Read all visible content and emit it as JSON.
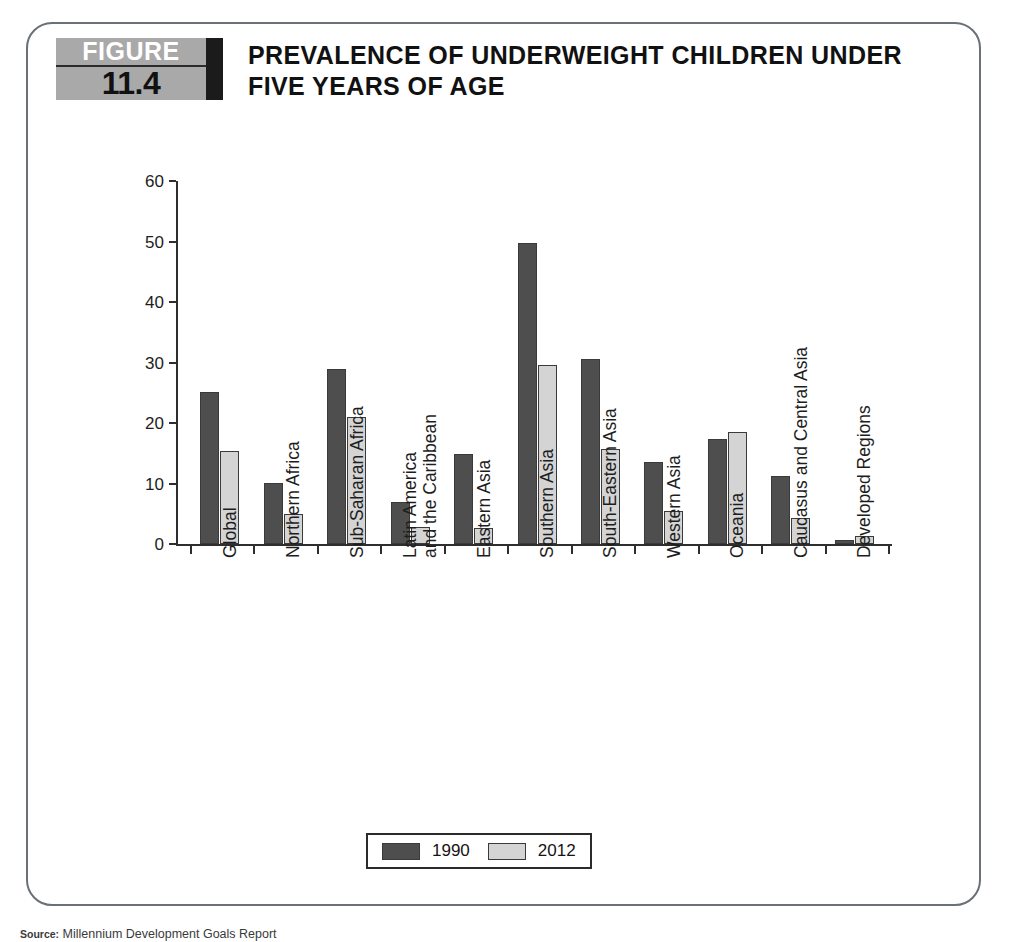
{
  "figure": {
    "badge_word": "FIGURE",
    "badge_number": "11.4",
    "title": "PREVALENCE OF UNDERWEIGHT CHILDREN UNDER FIVE YEARS OF AGE"
  },
  "legend": {
    "items": [
      {
        "label": "1990",
        "color": "#4e4e4e"
      },
      {
        "label": "2012",
        "color": "#d4d4d4"
      }
    ]
  },
  "source": {
    "lead": "Source:",
    "text": " Millennium Development Goals Report"
  },
  "chart_data": {
    "type": "bar",
    "title": "PREVALENCE OF UNDERWEIGHT CHILDREN UNDER FIVE YEARS OF AGE",
    "xlabel": "",
    "ylabel": "",
    "ylim": [
      0,
      60
    ],
    "yticks": [
      0,
      10,
      20,
      30,
      40,
      50,
      60
    ],
    "grid": false,
    "legend_position": "bottom",
    "categories": [
      "Global",
      "Northern Africa",
      "Sub-Saharan Africa",
      "Latin America and the Caribbean",
      "Eastern Asia",
      "Southern Asia",
      "South-Eastern Asia",
      "Western Asia",
      "Oceania",
      "Caucasus and Central Asia",
      "Developed Regions"
    ],
    "category_lines": [
      [
        "Global"
      ],
      [
        "Northern Africa"
      ],
      [
        "Sub-Saharan Africa"
      ],
      [
        "Latin America",
        "and the Caribbean"
      ],
      [
        "Eastern Asia"
      ],
      [
        "Southern Asia"
      ],
      [
        "South-Eastern Asia"
      ],
      [
        "Western Asia"
      ],
      [
        "Oceania"
      ],
      [
        "Caucasus and Central Asia"
      ],
      [
        "Developed Regions"
      ]
    ],
    "series": [
      {
        "name": "1990",
        "color": "#4e4e4e",
        "values": [
          25.2,
          10.1,
          29.0,
          6.9,
          14.8,
          49.7,
          30.6,
          13.6,
          17.4,
          11.3,
          0.6
        ]
      },
      {
        "name": "2012",
        "color": "#d4d4d4",
        "values": [
          15.3,
          5.0,
          21.0,
          2.8,
          2.7,
          29.6,
          15.7,
          5.4,
          18.5,
          4.3,
          1.4
        ]
      }
    ]
  }
}
